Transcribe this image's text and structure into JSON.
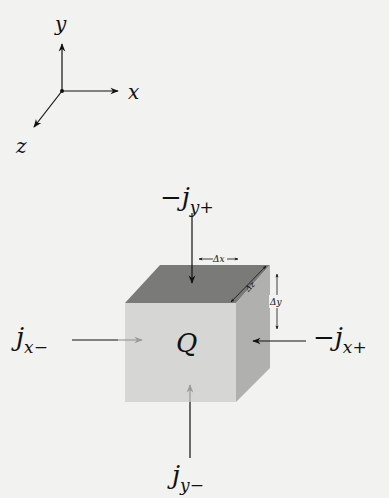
{
  "axes": {
    "x_label": "x",
    "y_label": "y",
    "z_label": "z"
  },
  "cube": {
    "center_label": "Q",
    "dim_x_label": "Δx",
    "dim_y_label": "Δy",
    "dim_z_label": "Δz",
    "colors": {
      "front": "#d6d6d4",
      "top": "#7a7a78",
      "side": "#b0b0ae"
    }
  },
  "fluxes": {
    "top": {
      "sign": "−",
      "base": "j",
      "sub": "y+"
    },
    "bottom": {
      "sign": "",
      "base": "j",
      "sub": "y−"
    },
    "left": {
      "sign": "",
      "base": "j",
      "sub": "x−"
    },
    "right": {
      "sign": "−",
      "base": "j",
      "sub": "x+"
    }
  },
  "colors": {
    "background": "#f2f2f0",
    "ink": "#111111",
    "faint_arrow": "#9a9a98"
  }
}
